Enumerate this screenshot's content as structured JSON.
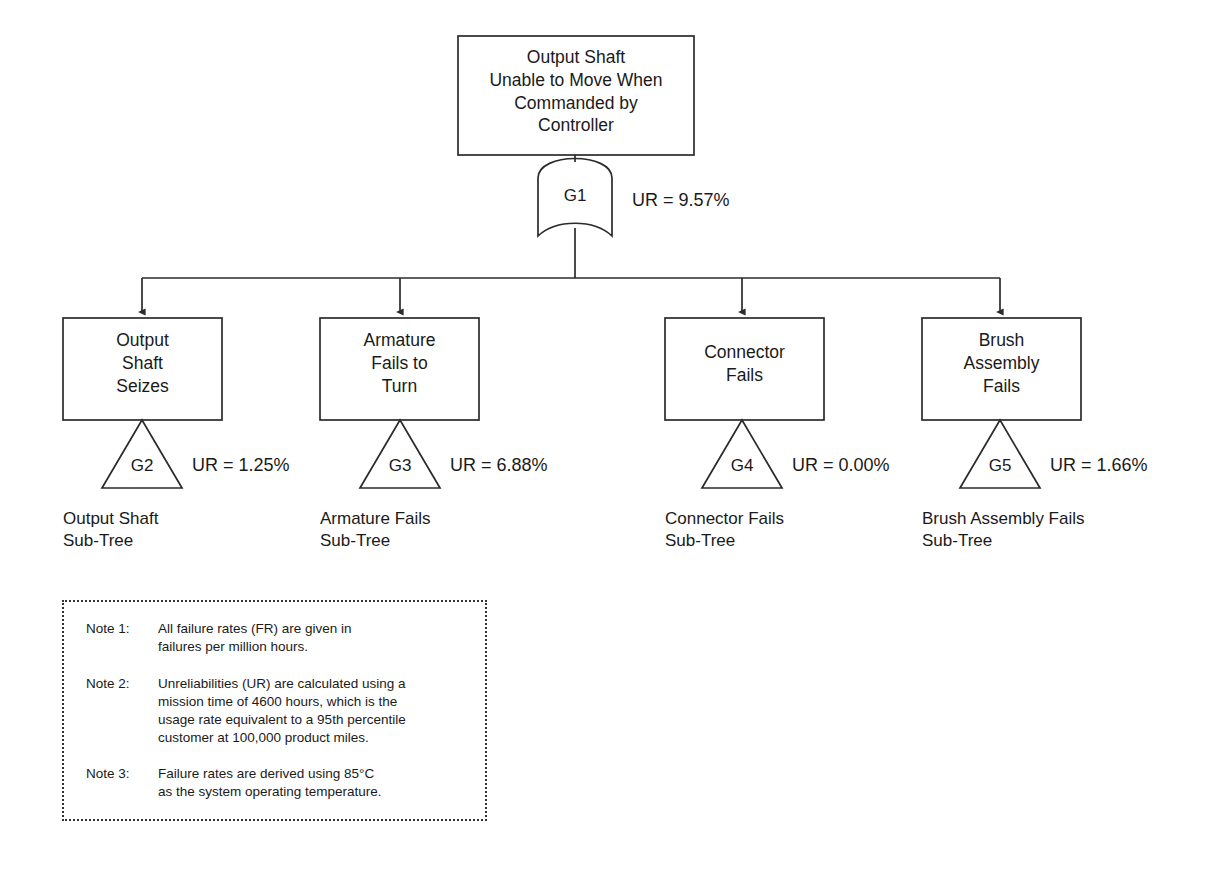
{
  "diagram": {
    "kind": "fault-tree",
    "title_event": {
      "id": "TOP",
      "text": "Output Shaft\nUnable to Move When\nCommanded by\nController"
    },
    "top_gate": {
      "id": "G1",
      "label": "G1",
      "type": "or-gate",
      "ur": "UR = 9.57%"
    },
    "branches": [
      {
        "event_text": "Output\nShaft\nSeizes",
        "gate_label": "G2",
        "gate_type": "transfer-triangle",
        "ur": "UR = 1.25%",
        "subtree_label": "Output Shaft\nSub-Tree"
      },
      {
        "event_text": "Armature\nFails to\nTurn",
        "gate_label": "G3",
        "gate_type": "transfer-triangle",
        "ur": "UR = 6.88%",
        "subtree_label": "Armature Fails\nSub-Tree"
      },
      {
        "event_text": "Connector\nFails",
        "gate_label": "G4",
        "gate_type": "transfer-triangle",
        "ur": "UR = 0.00%",
        "subtree_label": "Connector Fails\nSub-Tree"
      },
      {
        "event_text": "Brush\nAssembly\nFails",
        "gate_label": "G5",
        "gate_type": "transfer-triangle",
        "ur": "UR = 1.66%",
        "subtree_label": "Brush Assembly Fails\nSub-Tree"
      }
    ]
  },
  "notes": [
    {
      "key": "Note 1:",
      "body": "All failure rates (FR) are given in\nfailures per million hours."
    },
    {
      "key": "Note 2:",
      "body": "Unreliabilities (UR) are calculated using a\nmission time of 4600 hours, which is the\nusage rate equivalent to a 95th percentile\ncustomer at 100,000 product miles."
    },
    {
      "key": "Note 3:",
      "body": "Failure rates are derived using 85°C\nas the system operating temperature."
    }
  ],
  "colors": {
    "stroke": "#2b2b2b",
    "text": "#1a1a1a",
    "background": "#ffffff",
    "notes_border": "#333333"
  }
}
